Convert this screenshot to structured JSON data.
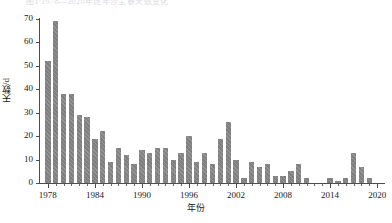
{
  "figure": {
    "cropped_caption": "图1 1978—2020年逐年沙尘暴天数变化"
  },
  "chart_data": {
    "type": "bar",
    "title": "",
    "xlabel": "年份",
    "ylabel": "天数/d",
    "ylim": [
      0,
      70
    ],
    "ytick_labels": [
      "0",
      "10",
      "20",
      "30",
      "40",
      "50",
      "60",
      "70"
    ],
    "ytick_values": [
      0,
      10,
      20,
      30,
      40,
      50,
      60,
      70
    ],
    "xtick_labels": [
      "1978",
      "1984",
      "1990",
      "1996",
      "2002",
      "2008",
      "2014",
      "2020"
    ],
    "xtick_values": [
      1978,
      1984,
      1990,
      1996,
      2002,
      2008,
      2014,
      2020
    ],
    "xlim": [
      1977,
      2021
    ],
    "grid": false,
    "legend": null,
    "bar_color": "#808080",
    "bar_hatch": "diagonal",
    "categories": [
      "1978",
      "1979",
      "1980",
      "1981",
      "1982",
      "1983",
      "1984",
      "1985",
      "1986",
      "1987",
      "1988",
      "1989",
      "1990",
      "1991",
      "1992",
      "1993",
      "1994",
      "1995",
      "1996",
      "1997",
      "1998",
      "1999",
      "2000",
      "2001",
      "2002",
      "2003",
      "2004",
      "2005",
      "2006",
      "2007",
      "2008",
      "2009",
      "2010",
      "2011",
      "2012",
      "2013",
      "2014",
      "2015",
      "2016",
      "2017",
      "2018",
      "2019",
      "2020"
    ],
    "values": [
      52,
      69,
      38,
      38,
      29,
      28,
      19,
      22,
      9,
      15,
      12,
      8,
      14,
      13,
      15,
      15,
      10,
      13,
      20,
      9,
      13,
      8,
      19,
      26,
      10,
      2,
      9,
      7,
      8,
      3,
      3,
      5,
      8,
      2,
      0,
      0,
      2,
      1,
      2,
      13,
      7,
      2,
      0
    ]
  }
}
